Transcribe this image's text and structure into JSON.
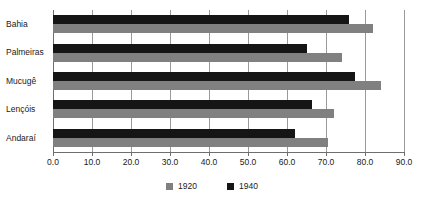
{
  "chart_data": {
    "type": "bar",
    "orientation": "horizontal",
    "title": "",
    "xlabel": "",
    "ylabel": "",
    "categories": [
      "Bahia",
      "Palmeiras",
      "Mucugê",
      "Lençóis",
      "Andaraí"
    ],
    "series": [
      {
        "name": "1920",
        "color": "#808080",
        "values": [
          82.0,
          74.0,
          84.0,
          72.0,
          70.5
        ]
      },
      {
        "name": "1940",
        "color": "#151515",
        "values": [
          76.0,
          65.0,
          77.5,
          66.5,
          62.0
        ]
      }
    ],
    "xlim": [
      0.0,
      90.0
    ],
    "xticks": [
      0.0,
      10.0,
      20.0,
      30.0,
      40.0,
      50.0,
      60.0,
      70.0,
      80.0,
      90.0
    ],
    "xticklabels": [
      "0.0",
      "10.0",
      "20.0",
      "30.0",
      "40.0",
      "50.0",
      "60.0",
      "70.0",
      "80.0",
      "90.0"
    ],
    "grid": true,
    "grid_axis": "x",
    "legend": [
      "1920",
      "1940"
    ],
    "legend_position": "bottom"
  },
  "colors": {
    "series_1920": "#808080",
    "series_1940": "#151515",
    "gridline": "#9a9a9a",
    "axis": "#6e6e6e",
    "text": "#1a1a1a",
    "background": "#ffffff"
  }
}
